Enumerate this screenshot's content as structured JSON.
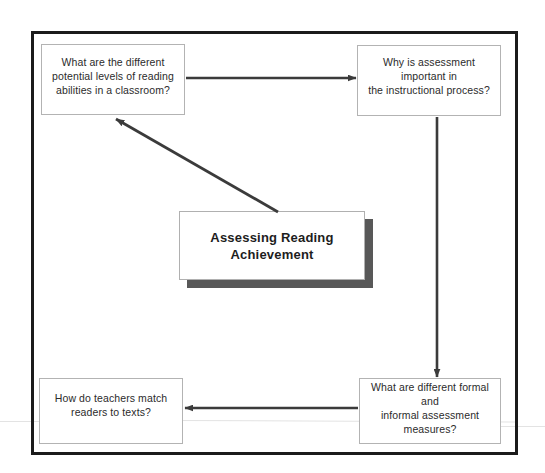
{
  "diagram": {
    "title": "Assessing Reading Achievement",
    "center_node": {
      "label": "Assessing Reading Achievement",
      "shadow_color": "#585858",
      "fill_color": "#ffffff",
      "border_color": "#b0b0b0"
    },
    "frame": {
      "border_color": "#1b1b1b",
      "border_width": "3px"
    },
    "nodes": [
      {
        "id": "top-left",
        "label": "What are the different potential levels of reading abilities in a classroom?",
        "lines": [
          "What are the different",
          "potential levels of reading",
          "abilities in a classroom?"
        ]
      },
      {
        "id": "top-right",
        "label": "Why is assessment important in the instructional process?",
        "lines": [
          "Why is assessment important in",
          "the instructional process?"
        ]
      },
      {
        "id": "bottom-right",
        "label": "What are different formal and informal assessment measures?",
        "lines": [
          "What are different formal and",
          "informal assessment",
          "measures?"
        ]
      },
      {
        "id": "bottom-left",
        "label": "How do teachers match readers to texts?",
        "lines": [
          "How do teachers match",
          "readers to texts?"
        ]
      }
    ],
    "edges": [
      {
        "id": "edge-top",
        "from": "top-left",
        "to": "top-right",
        "direction": "right",
        "style": "solid-arrow"
      },
      {
        "id": "edge-right",
        "from": "top-right",
        "to": "bottom-right",
        "direction": "down",
        "style": "solid-arrow"
      },
      {
        "id": "edge-bottom",
        "from": "bottom-right",
        "to": "bottom-left",
        "direction": "left",
        "style": "solid-arrow"
      },
      {
        "id": "edge-diagonal",
        "from": "center-node",
        "to": "top-left",
        "direction": "up-left",
        "style": "solid-arrow"
      }
    ],
    "colors": {
      "arrow": "#3b3b3b",
      "node_border": "#b3b3b3",
      "text": "#2b2b2b",
      "background": "#ffffff"
    }
  }
}
